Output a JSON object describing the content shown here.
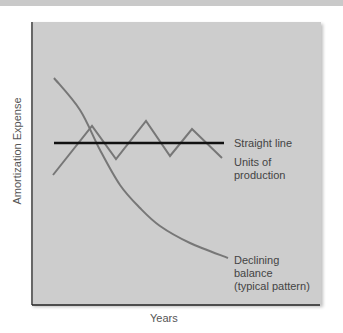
{
  "chart_data": {
    "type": "line",
    "title": "",
    "xlabel": "Years",
    "ylabel": "Amortization Expense",
    "grid": false,
    "legend": "inline labels at right",
    "series": [
      {
        "name": "Straight line",
        "label": "Straight line",
        "pattern": "constant",
        "points": [
          [
            54,
            143
          ],
          [
            224,
            143
          ]
        ],
        "color": "#111111"
      },
      {
        "name": "Units of production",
        "label_lines": [
          "Units of",
          "production"
        ],
        "pattern": "zigzag",
        "points": [
          [
            53,
            175
          ],
          [
            92,
            126
          ],
          [
            116,
            159
          ],
          [
            146,
            121
          ],
          [
            170,
            156
          ],
          [
            192,
            129
          ],
          [
            222,
            158
          ]
        ],
        "color": "#777777"
      },
      {
        "name": "Declining balance (typical pattern)",
        "label_lines": [
          "Declining",
          "balance",
          "(typical pattern)"
        ],
        "pattern": "decreasing curve",
        "points": [
          [
            54,
            78
          ],
          [
            80,
            110
          ],
          [
            100,
            150
          ],
          [
            120,
            185
          ],
          [
            140,
            208
          ],
          [
            160,
            226
          ],
          [
            190,
            243
          ],
          [
            228,
            258
          ]
        ],
        "color": "#777777"
      }
    ]
  },
  "labels": {
    "straight": "Straight line",
    "units1": "Units of",
    "units2": "production",
    "decl1": "Declining",
    "decl2": "balance",
    "decl3": "(typical pattern)",
    "x": "Years",
    "y": "Amortization Expense"
  }
}
